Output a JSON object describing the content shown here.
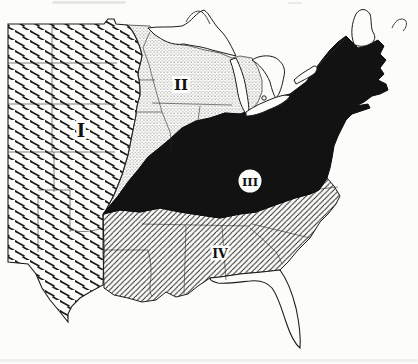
{
  "figure": {
    "kind": "scanned-print-region-map",
    "area_depicted": "central and eastern United States with Great Lakes, Gulf and Atlantic coasts",
    "background_color": "#fcfcfa",
    "ink_color": "#161616",
    "black_region_color": "#121212"
  },
  "map": {
    "regions": [
      {
        "numeral": "I",
        "shading": "broken-diagonal-dash-hatch"
      },
      {
        "numeral": "II",
        "shading": "fine-dot-stipple"
      },
      {
        "numeral": "III",
        "shading": "solid-black-with-white-disc-label"
      },
      {
        "numeral": "IV",
        "shading": "thin-diagonal-line-hatch"
      }
    ]
  }
}
